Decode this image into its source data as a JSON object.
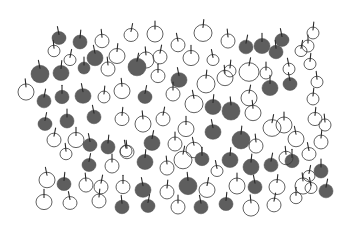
{
  "illustration": {
    "title": "",
    "width": 352,
    "height": 225,
    "background": "#ffffff",
    "fill_color": "#5e5e5e",
    "outline_color": "#3a3a3a",
    "apples": [
      {
        "x": 59,
        "y": 38,
        "r": 7,
        "f": 1
      },
      {
        "x": 80,
        "y": 42,
        "r": 7,
        "f": 1
      },
      {
        "x": 102,
        "y": 41,
        "r": 7,
        "f": 0
      },
      {
        "x": 131,
        "y": 35,
        "r": 7,
        "f": 0
      },
      {
        "x": 155,
        "y": 34,
        "r": 8,
        "f": 0
      },
      {
        "x": 178,
        "y": 45,
        "r": 7,
        "f": 0
      },
      {
        "x": 203,
        "y": 33,
        "r": 9,
        "f": 0
      },
      {
        "x": 228,
        "y": 41,
        "r": 7,
        "f": 0
      },
      {
        "x": 246,
        "y": 47,
        "r": 7,
        "f": 1
      },
      {
        "x": 262,
        "y": 46,
        "r": 8,
        "f": 1
      },
      {
        "x": 282,
        "y": 40,
        "r": 7,
        "f": 1
      },
      {
        "x": 313,
        "y": 33,
        "r": 6,
        "f": 0
      },
      {
        "x": 54,
        "y": 51,
        "r": 6,
        "f": 0
      },
      {
        "x": 70,
        "y": 60,
        "r": 6,
        "f": 0
      },
      {
        "x": 84,
        "y": 68,
        "r": 6,
        "f": 1
      },
      {
        "x": 95,
        "y": 58,
        "r": 8,
        "f": 1
      },
      {
        "x": 117,
        "y": 56,
        "r": 8,
        "f": 0
      },
      {
        "x": 146,
        "y": 60,
        "r": 8,
        "f": 0
      },
      {
        "x": 160,
        "y": 57,
        "r": 7,
        "f": 0
      },
      {
        "x": 191,
        "y": 58,
        "r": 8,
        "f": 0
      },
      {
        "x": 213,
        "y": 60,
        "r": 6,
        "f": 0
      },
      {
        "x": 230,
        "y": 71,
        "r": 6,
        "f": 0
      },
      {
        "x": 276,
        "y": 52,
        "r": 7,
        "f": 1
      },
      {
        "x": 301,
        "y": 51,
        "r": 6,
        "f": 0
      },
      {
        "x": 308,
        "y": 46,
        "r": 6,
        "f": 0
      },
      {
        "x": 40,
        "y": 74,
        "r": 9,
        "f": 1
      },
      {
        "x": 61,
        "y": 73,
        "r": 8,
        "f": 1
      },
      {
        "x": 108,
        "y": 69,
        "r": 7,
        "f": 0
      },
      {
        "x": 137,
        "y": 67,
        "r": 9,
        "f": 1
      },
      {
        "x": 158,
        "y": 76,
        "r": 7,
        "f": 0
      },
      {
        "x": 179,
        "y": 80,
        "r": 8,
        "f": 1
      },
      {
        "x": 206,
        "y": 84,
        "r": 9,
        "f": 0
      },
      {
        "x": 225,
        "y": 78,
        "r": 8,
        "f": 0
      },
      {
        "x": 249,
        "y": 72,
        "r": 10,
        "f": 0
      },
      {
        "x": 266,
        "y": 73,
        "r": 6,
        "f": 0
      },
      {
        "x": 289,
        "y": 69,
        "r": 6,
        "f": 0
      },
      {
        "x": 310,
        "y": 64,
        "r": 6,
        "f": 0
      },
      {
        "x": 26,
        "y": 92,
        "r": 8,
        "f": 0
      },
      {
        "x": 44,
        "y": 101,
        "r": 7,
        "f": 1
      },
      {
        "x": 62,
        "y": 97,
        "r": 7,
        "f": 1
      },
      {
        "x": 83,
        "y": 96,
        "r": 8,
        "f": 1
      },
      {
        "x": 104,
        "y": 97,
        "r": 6,
        "f": 0
      },
      {
        "x": 122,
        "y": 91,
        "r": 8,
        "f": 0
      },
      {
        "x": 145,
        "y": 97,
        "r": 7,
        "f": 1
      },
      {
        "x": 173,
        "y": 94,
        "r": 7,
        "f": 0
      },
      {
        "x": 194,
        "y": 104,
        "r": 9,
        "f": 0
      },
      {
        "x": 213,
        "y": 107,
        "r": 8,
        "f": 1
      },
      {
        "x": 231,
        "y": 111,
        "r": 9,
        "f": 1
      },
      {
        "x": 249,
        "y": 98,
        "r": 8,
        "f": 0
      },
      {
        "x": 270,
        "y": 88,
        "r": 8,
        "f": 1
      },
      {
        "x": 290,
        "y": 84,
        "r": 7,
        "f": 1
      },
      {
        "x": 313,
        "y": 99,
        "r": 6,
        "f": 0
      },
      {
        "x": 317,
        "y": 82,
        "r": 6,
        "f": 0
      },
      {
        "x": 45,
        "y": 124,
        "r": 7,
        "f": 1
      },
      {
        "x": 67,
        "y": 121,
        "r": 7,
        "f": 1
      },
      {
        "x": 94,
        "y": 117,
        "r": 7,
        "f": 1
      },
      {
        "x": 122,
        "y": 119,
        "r": 7,
        "f": 0
      },
      {
        "x": 143,
        "y": 124,
        "r": 8,
        "f": 0
      },
      {
        "x": 163,
        "y": 119,
        "r": 7,
        "f": 0
      },
      {
        "x": 186,
        "y": 129,
        "r": 8,
        "f": 0
      },
      {
        "x": 213,
        "y": 132,
        "r": 8,
        "f": 1
      },
      {
        "x": 241,
        "y": 140,
        "r": 9,
        "f": 1
      },
      {
        "x": 253,
        "y": 113,
        "r": 8,
        "f": 0
      },
      {
        "x": 272,
        "y": 128,
        "r": 9,
        "f": 0
      },
      {
        "x": 284,
        "y": 125,
        "r": 8,
        "f": 0
      },
      {
        "x": 296,
        "y": 139,
        "r": 8,
        "f": 0
      },
      {
        "x": 315,
        "y": 119,
        "r": 7,
        "f": 0
      },
      {
        "x": 325,
        "y": 125,
        "r": 6,
        "f": 0
      },
      {
        "x": 54,
        "y": 140,
        "r": 7,
        "f": 0
      },
      {
        "x": 76,
        "y": 140,
        "r": 8,
        "f": 0
      },
      {
        "x": 90,
        "y": 145,
        "r": 7,
        "f": 1
      },
      {
        "x": 108,
        "y": 147,
        "r": 7,
        "f": 1
      },
      {
        "x": 127,
        "y": 152,
        "r": 7,
        "f": 0
      },
      {
        "x": 152,
        "y": 143,
        "r": 8,
        "f": 1
      },
      {
        "x": 175,
        "y": 144,
        "r": 7,
        "f": 0
      },
      {
        "x": 194,
        "y": 150,
        "r": 8,
        "f": 0
      },
      {
        "x": 230,
        "y": 160,
        "r": 8,
        "f": 1
      },
      {
        "x": 256,
        "y": 146,
        "r": 7,
        "f": 0
      },
      {
        "x": 271,
        "y": 165,
        "r": 7,
        "f": 1
      },
      {
        "x": 292,
        "y": 161,
        "r": 7,
        "f": 1
      },
      {
        "x": 309,
        "y": 154,
        "r": 7,
        "f": 0
      },
      {
        "x": 321,
        "y": 142,
        "r": 7,
        "f": 0
      },
      {
        "x": 66,
        "y": 154,
        "r": 6,
        "f": 0
      },
      {
        "x": 89,
        "y": 165,
        "r": 7,
        "f": 1
      },
      {
        "x": 112,
        "y": 166,
        "r": 7,
        "f": 0
      },
      {
        "x": 126,
        "y": 151,
        "r": 6,
        "f": 0
      },
      {
        "x": 145,
        "y": 162,
        "r": 8,
        "f": 1
      },
      {
        "x": 167,
        "y": 168,
        "r": 7,
        "f": 0
      },
      {
        "x": 183,
        "y": 160,
        "r": 9,
        "f": 0
      },
      {
        "x": 202,
        "y": 159,
        "r": 7,
        "f": 1
      },
      {
        "x": 217,
        "y": 171,
        "r": 6,
        "f": 0
      },
      {
        "x": 251,
        "y": 167,
        "r": 8,
        "f": 1
      },
      {
        "x": 286,
        "y": 158,
        "r": 7,
        "f": 0
      },
      {
        "x": 309,
        "y": 176,
        "r": 6,
        "f": 0
      },
      {
        "x": 321,
        "y": 171,
        "r": 7,
        "f": 1
      },
      {
        "x": 47,
        "y": 180,
        "r": 8,
        "f": 0
      },
      {
        "x": 64,
        "y": 184,
        "r": 7,
        "f": 1
      },
      {
        "x": 86,
        "y": 185,
        "r": 7,
        "f": 0
      },
      {
        "x": 101,
        "y": 187,
        "r": 7,
        "f": 0
      },
      {
        "x": 123,
        "y": 187,
        "r": 7,
        "f": 0
      },
      {
        "x": 143,
        "y": 190,
        "r": 8,
        "f": 1
      },
      {
        "x": 167,
        "y": 192,
        "r": 7,
        "f": 0
      },
      {
        "x": 188,
        "y": 186,
        "r": 9,
        "f": 1
      },
      {
        "x": 207,
        "y": 190,
        "r": 8,
        "f": 0
      },
      {
        "x": 237,
        "y": 186,
        "r": 8,
        "f": 0
      },
      {
        "x": 255,
        "y": 187,
        "r": 7,
        "f": 1
      },
      {
        "x": 277,
        "y": 187,
        "r": 8,
        "f": 0
      },
      {
        "x": 303,
        "y": 186,
        "r": 8,
        "f": 0
      },
      {
        "x": 326,
        "y": 191,
        "r": 7,
        "f": 1
      },
      {
        "x": 44,
        "y": 202,
        "r": 8,
        "f": 0
      },
      {
        "x": 70,
        "y": 203,
        "r": 7,
        "f": 0
      },
      {
        "x": 99,
        "y": 201,
        "r": 7,
        "f": 0
      },
      {
        "x": 122,
        "y": 207,
        "r": 7,
        "f": 1
      },
      {
        "x": 148,
        "y": 206,
        "r": 7,
        "f": 1
      },
      {
        "x": 178,
        "y": 207,
        "r": 7,
        "f": 0
      },
      {
        "x": 201,
        "y": 207,
        "r": 7,
        "f": 1
      },
      {
        "x": 226,
        "y": 204,
        "r": 7,
        "f": 1
      },
      {
        "x": 251,
        "y": 208,
        "r": 8,
        "f": 0
      },
      {
        "x": 274,
        "y": 205,
        "r": 7,
        "f": 0
      },
      {
        "x": 296,
        "y": 198,
        "r": 6,
        "f": 0
      },
      {
        "x": 311,
        "y": 188,
        "r": 6,
        "f": 0
      }
    ]
  }
}
